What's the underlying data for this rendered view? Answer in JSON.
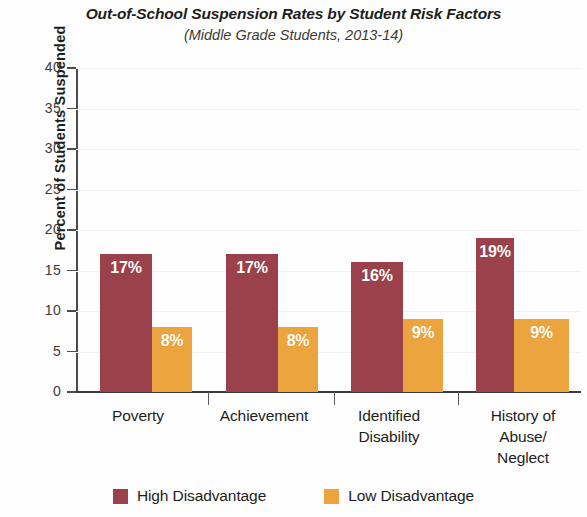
{
  "chart_data": {
    "type": "bar",
    "title": "Out-of-School Suspension Rates by Student Risk Factors",
    "subtitle": "(Middle Grade Students, 2013-14)",
    "xlabel": "",
    "ylabel": "Percent of Students Suspended",
    "ylim": [
      0,
      40
    ],
    "ytick_step": 5,
    "yticks": [
      "40",
      "35",
      "30",
      "25",
      "20",
      "15",
      "10",
      "5",
      "0"
    ],
    "ytick_values": [
      40,
      35,
      30,
      25,
      20,
      15,
      10,
      5,
      0
    ],
    "grid": true,
    "legend_position": "bottom-center",
    "categories": [
      "Poverty",
      "Achievement",
      "Identified\nDisability",
      "History of\nAbuse/\nNeglect"
    ],
    "category_lines": [
      [
        "Poverty"
      ],
      [
        "Achievement"
      ],
      [
        "Identified",
        "Disability"
      ],
      [
        "History of",
        "Abuse/",
        "Neglect"
      ]
    ],
    "series": [
      {
        "name": "High Disadvantage",
        "color": "#9b414b",
        "values": [
          17,
          17,
          16,
          19
        ],
        "labels": [
          "17%",
          "17%",
          "16%",
          "19%"
        ]
      },
      {
        "name": "Low Disadvantage",
        "color": "#eca53e",
        "values": [
          8,
          8,
          9,
          9
        ],
        "labels": [
          "8%",
          "8%",
          "9%",
          "9%"
        ]
      }
    ]
  },
  "legend": {
    "items": [
      {
        "label": "High Disadvantage",
        "color": "#9b414b"
      },
      {
        "label": "Low Disadvantage",
        "color": "#eca53e"
      }
    ]
  }
}
